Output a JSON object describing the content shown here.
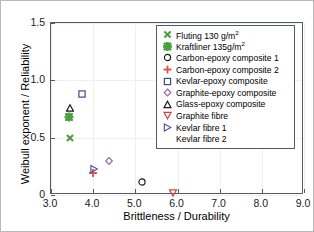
{
  "chart_data": {
    "type": "scatter",
    "title": "",
    "xlabel": "Brittleness / Durability",
    "ylabel": "Weibull exponent / Reliability",
    "xlim": [
      3.0,
      9.0
    ],
    "ylim": [
      0.0,
      1.5
    ],
    "xticks": [
      "3.0",
      "4.0",
      "5.0",
      "6.0",
      "7.0",
      "8.0",
      "9.0"
    ],
    "xtick_values": [
      3.0,
      4.0,
      5.0,
      6.0,
      7.0,
      8.0,
      9.0
    ],
    "yticks": [
      "0",
      "0.5",
      "1.0",
      "1.5"
    ],
    "ytick_values": [
      0.0,
      0.5,
      1.0,
      1.5
    ],
    "grid": true,
    "legend_position": "upper right",
    "series": [
      {
        "name": "Fluting 130 g/m2",
        "label_main": "Fluting 130 g/m",
        "label_sup": "2",
        "marker": "x-cross",
        "color": "#4aa03c",
        "x": [
          3.45
        ],
        "y": [
          0.5
        ]
      },
      {
        "name": "Kraftliner 135g/m2",
        "label_main": "Kraftliner 135g/m",
        "label_sup": "2",
        "marker": "asterisk-filled",
        "color": "#4aa03c",
        "x": [
          3.42
        ],
        "y": [
          0.68
        ]
      },
      {
        "name": "Carbon-epoxy composite 1",
        "label_main": "Carbon-epoxy composite 1",
        "label_sup": "",
        "marker": "circle",
        "color": "#1a1a1a",
        "x": [
          5.15
        ],
        "y": [
          0.11
        ]
      },
      {
        "name": "Carbon-epoxy composite 2",
        "label_main": "Carbon-epoxy composite 2",
        "label_sup": "",
        "marker": "plus",
        "color": "#e2544a",
        "x": [
          4.0
        ],
        "y": [
          0.19
        ]
      },
      {
        "name": "Kevlar-epoxy composite",
        "label_main": "Kevlar-epoxy composite",
        "label_sup": "",
        "marker": "square",
        "color": "#3d4a8c",
        "x": [
          3.74
        ],
        "y": [
          0.88
        ]
      },
      {
        "name": "Graphite-epoxy composite",
        "label_main": "Graphite-epoxy composite",
        "label_sup": "",
        "marker": "diamond",
        "color": "#9a6a9e",
        "x": [
          4.38
        ],
        "y": [
          0.3
        ]
      },
      {
        "name": "Glass-epoxy composite",
        "label_main": "Glass-epoxy composite",
        "label_sup": "",
        "marker": "triangle-up",
        "color": "#1a1a1a",
        "x": [
          3.44
        ],
        "y": [
          0.755
        ]
      },
      {
        "name": "Graphite fibre",
        "label_main": "Graphite fibre",
        "label_sup": "",
        "marker": "triangle-down",
        "color": "#d2453f",
        "x": [
          5.9
        ],
        "y": [
          0.02
        ]
      },
      {
        "name": "Kevlar fibre 1",
        "label_main": "Kevlar fibre 1",
        "label_sup": "",
        "marker": "triangle-right",
        "color": "#4d57a8",
        "x": [
          4.03
        ],
        "y": [
          0.225
        ]
      },
      {
        "name": "Kevlar fibre 2",
        "label_main": "Kevlar fibre 2",
        "label_sup": "",
        "marker": "triangle-left",
        "color": "#c druck"
      }
    ]
  },
  "legend": {
    "entries": [
      {
        "main": "Fluting 130 g/m",
        "sup": "2"
      },
      {
        "main": "Kraftliner 135g/m",
        "sup": "2"
      },
      {
        "main": "Carbon-epoxy composite 1",
        "sup": ""
      },
      {
        "main": "Carbon-epoxy composite 2",
        "sup": ""
      },
      {
        "main": "Kevlar-epoxy composite",
        "sup": ""
      },
      {
        "main": "Graphite-epoxy composite",
        "sup": ""
      },
      {
        "main": "Glass-epoxy composite",
        "sup": ""
      },
      {
        "main": "Graphite fibre",
        "sup": ""
      },
      {
        "main": "Kevlar fibre 1",
        "sup": ""
      },
      {
        "main": "Kevlar fibre 2",
        "sup": ""
      }
    ]
  },
  "axes": {
    "xlabel": "Brittleness / Durability",
    "ylabel": "Weibull exponent / Reliability"
  }
}
